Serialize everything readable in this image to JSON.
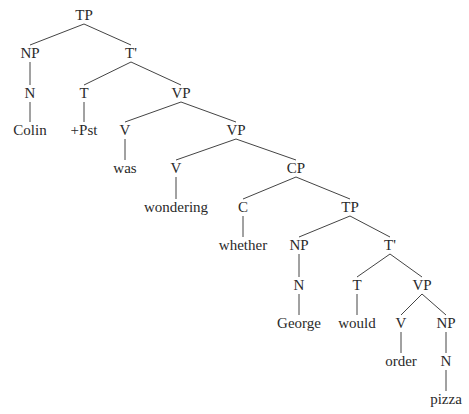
{
  "diagram": {
    "type": "syntax-tree",
    "nodes": [
      {
        "id": "n0",
        "label": "TP",
        "x": 84,
        "y": 20
      },
      {
        "id": "n1",
        "label": "NP",
        "x": 30,
        "y": 58
      },
      {
        "id": "n2",
        "label": "N",
        "x": 30,
        "y": 98
      },
      {
        "id": "n3",
        "label": "Colin",
        "x": 30,
        "y": 135
      },
      {
        "id": "n4",
        "label": "T'",
        "x": 131,
        "y": 58
      },
      {
        "id": "n5",
        "label": "T",
        "x": 84,
        "y": 98
      },
      {
        "id": "n6",
        "label": "+Pst",
        "x": 84,
        "y": 135
      },
      {
        "id": "n7",
        "label": "VP",
        "x": 181,
        "y": 98
      },
      {
        "id": "n8",
        "label": "V",
        "x": 125,
        "y": 135
      },
      {
        "id": "n9",
        "label": "was",
        "x": 125,
        "y": 173
      },
      {
        "id": "n10",
        "label": "VP",
        "x": 236,
        "y": 135
      },
      {
        "id": "n11",
        "label": "V",
        "x": 176,
        "y": 173
      },
      {
        "id": "n12",
        "label": "wondering",
        "x": 176,
        "y": 212
      },
      {
        "id": "n13",
        "label": "CP",
        "x": 296,
        "y": 173
      },
      {
        "id": "n14",
        "label": "C",
        "x": 243,
        "y": 212
      },
      {
        "id": "n15",
        "label": "whether",
        "x": 243,
        "y": 250
      },
      {
        "id": "n16",
        "label": "TP",
        "x": 350,
        "y": 212
      },
      {
        "id": "n17",
        "label": "NP",
        "x": 299,
        "y": 250
      },
      {
        "id": "n18",
        "label": "N",
        "x": 299,
        "y": 290
      },
      {
        "id": "n19",
        "label": "George",
        "x": 299,
        "y": 328
      },
      {
        "id": "n20",
        "label": "T'",
        "x": 390,
        "y": 250
      },
      {
        "id": "n21",
        "label": "T",
        "x": 357,
        "y": 290
      },
      {
        "id": "n22",
        "label": "would",
        "x": 357,
        "y": 328
      },
      {
        "id": "n23",
        "label": "VP",
        "x": 422,
        "y": 290
      },
      {
        "id": "n24",
        "label": "V",
        "x": 401,
        "y": 328
      },
      {
        "id": "n25",
        "label": "order",
        "x": 401,
        "y": 366
      },
      {
        "id": "n26",
        "label": "NP",
        "x": 446,
        "y": 328
      },
      {
        "id": "n27",
        "label": "N",
        "x": 446,
        "y": 366
      },
      {
        "id": "n28",
        "label": "pizza",
        "x": 446,
        "y": 404
      }
    ],
    "edges": [
      [
        "n0",
        "n1"
      ],
      [
        "n0",
        "n4"
      ],
      [
        "n1",
        "n2"
      ],
      [
        "n2",
        "n3"
      ],
      [
        "n4",
        "n5"
      ],
      [
        "n4",
        "n7"
      ],
      [
        "n5",
        "n6"
      ],
      [
        "n7",
        "n8"
      ],
      [
        "n7",
        "n10"
      ],
      [
        "n8",
        "n9"
      ],
      [
        "n10",
        "n11"
      ],
      [
        "n10",
        "n13"
      ],
      [
        "n11",
        "n12"
      ],
      [
        "n13",
        "n14"
      ],
      [
        "n13",
        "n16"
      ],
      [
        "n14",
        "n15"
      ],
      [
        "n16",
        "n17"
      ],
      [
        "n16",
        "n20"
      ],
      [
        "n17",
        "n18"
      ],
      [
        "n18",
        "n19"
      ],
      [
        "n20",
        "n21"
      ],
      [
        "n20",
        "n23"
      ],
      [
        "n21",
        "n22"
      ],
      [
        "n23",
        "n24"
      ],
      [
        "n23",
        "n26"
      ],
      [
        "n24",
        "n25"
      ],
      [
        "n26",
        "n27"
      ],
      [
        "n27",
        "n28"
      ]
    ]
  }
}
